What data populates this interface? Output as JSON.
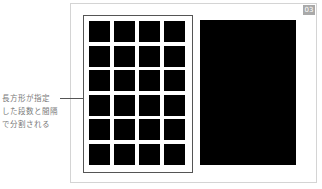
{
  "badge": {
    "label": "03"
  },
  "annotation": {
    "lines": [
      "長方形が指定",
      "した段数と間隔",
      "で分割される"
    ]
  },
  "grid": {
    "rows": 6,
    "columns": 4,
    "cell_color": "#000000",
    "border_color": "#555555"
  },
  "colors": {
    "frame": "#d4d4d4",
    "badge_bg": "#a9a9a9",
    "label_text": "#777777"
  }
}
